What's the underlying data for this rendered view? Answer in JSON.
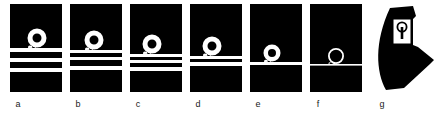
{
  "figure": {
    "background_color": "#ffffff",
    "panel_fill": "#000000",
    "stripe_color": "#ffffff",
    "line_color": "#ffffff",
    "panel_width": 52,
    "panel_height": 88,
    "panels": [
      {
        "label": "a",
        "name": "panel-a",
        "x": 10,
        "label_x": 8,
        "stripe_count": 3,
        "stripes": [
          {
            "y": 44,
            "height": 4
          },
          {
            "y": 54,
            "height": 4
          },
          {
            "y": 64,
            "height": 4
          }
        ],
        "spiral": {
          "cx": 27,
          "cy": 34,
          "r_outer": 9.5,
          "r_inner": 4.5,
          "tail_y": 44,
          "tail_x": 14
        }
      },
      {
        "label": "b",
        "name": "panel-b",
        "x": 70,
        "label_x": 68,
        "stripe_count": 3,
        "stripes": [
          {
            "y": 46,
            "height": 3
          },
          {
            "y": 53,
            "height": 3
          },
          {
            "y": 62,
            "height": 4
          }
        ],
        "spiral": {
          "cx": 24,
          "cy": 36,
          "r_outer": 9.5,
          "r_inner": 4.5,
          "tail_y": 46,
          "tail_x": 11
        }
      },
      {
        "label": "c",
        "name": "panel-c",
        "x": 130,
        "label_x": 128,
        "stripe_count": 3,
        "stripes": [
          {
            "y": 50,
            "height": 3
          },
          {
            "y": 56,
            "height": 3
          },
          {
            "y": 63,
            "height": 4
          }
        ],
        "spiral": {
          "cx": 22,
          "cy": 40,
          "r_outer": 9.5,
          "r_inner": 4.5,
          "tail_y": 50,
          "tail_x": 9
        }
      },
      {
        "label": "d",
        "name": "panel-d",
        "x": 190,
        "label_x": 188,
        "stripe_count": 2,
        "stripes": [
          {
            "y": 52,
            "height": 3
          },
          {
            "y": 58,
            "height": 4
          }
        ],
        "spiral": {
          "cx": 22,
          "cy": 42,
          "r_outer": 9.5,
          "r_inner": 4.5,
          "tail_y": 52,
          "tail_x": 9
        }
      },
      {
        "label": "e",
        "name": "panel-e",
        "x": 250,
        "label_x": 248,
        "stripe_count": 1,
        "stripes": [
          {
            "y": 58,
            "height": 3
          }
        ],
        "spiral": {
          "cx": 22,
          "cy": 49,
          "r_outer": 8.5,
          "r_inner": 4.0,
          "tail_y": 58,
          "tail_x": 4
        }
      },
      {
        "label": "f",
        "name": "panel-f",
        "x": 310,
        "label_x": 308,
        "stripe_count": 1,
        "stripes": [
          {
            "y": 60,
            "height": 1.6
          }
        ],
        "spiral": {
          "cx": 26,
          "cy": 52,
          "r_outer": 8.0,
          "r_inner": 6.2,
          "tail_y": 60,
          "tail_x": 0
        }
      }
    ],
    "final_shape": {
      "label": "g",
      "name": "panel-g",
      "x": 366,
      "label_x": 372,
      "fill": "#000000",
      "marker": {
        "name": "keyhole-marker",
        "box_x": 27,
        "box_y": 17,
        "box_w": 18,
        "box_h": 25,
        "box_fill": "#ffffff",
        "glyph_fill": "#000000",
        "circle_cx": 36,
        "circle_cy": 25,
        "circle_r": 4.6,
        "stem_w": 2.6,
        "stem_h": 12
      }
    }
  }
}
